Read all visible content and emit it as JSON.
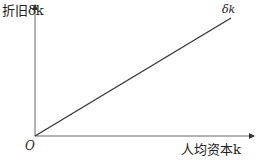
{
  "diagram": {
    "y_axis_label": "折旧δk",
    "x_axis_label": "人均资本k",
    "origin_label": "O",
    "line_label": "δk",
    "colors": {
      "axis": "#555555",
      "line": "#333333",
      "text": "#222222"
    }
  }
}
